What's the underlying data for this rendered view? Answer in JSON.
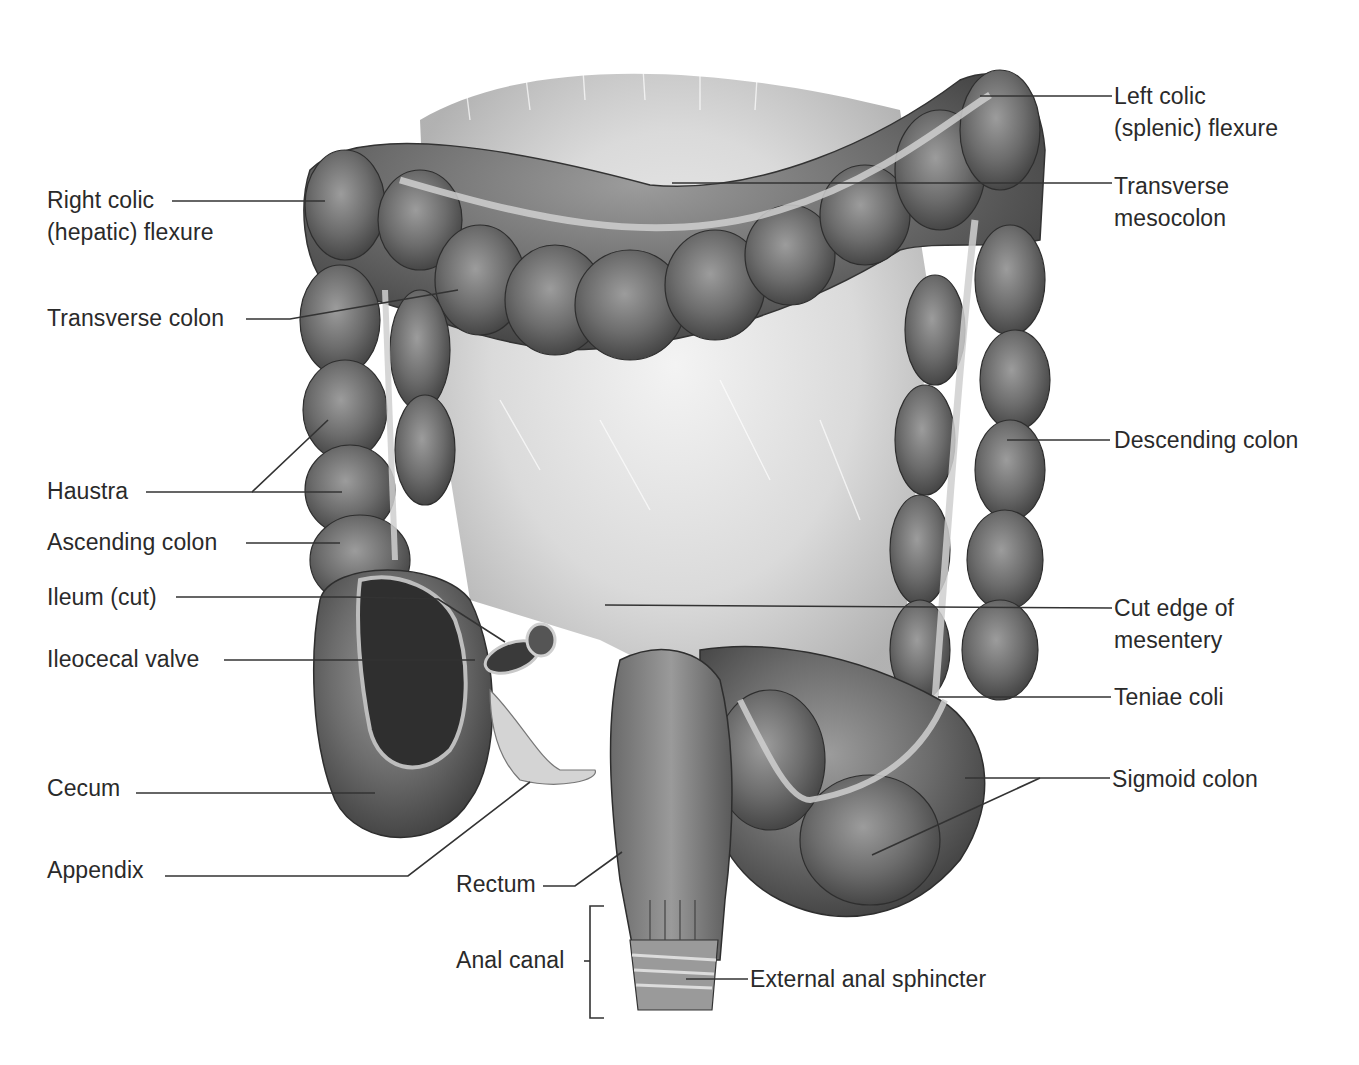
{
  "figure": {
    "labels_left": [
      {
        "id": "right-colic-flexure",
        "text": "Right colic\n(hepatic) flexure",
        "x": 47,
        "y": 184
      },
      {
        "id": "transverse-colon",
        "text": "Transverse colon",
        "x": 47,
        "y": 302
      },
      {
        "id": "haustra",
        "text": "Haustra",
        "x": 47,
        "y": 475
      },
      {
        "id": "ascending-colon",
        "text": "Ascending colon",
        "x": 47,
        "y": 526
      },
      {
        "id": "ileum-cut",
        "text": "Ileum (cut)",
        "x": 47,
        "y": 581
      },
      {
        "id": "ileocecal-valve",
        "text": "Ileocecal valve",
        "x": 47,
        "y": 643
      },
      {
        "id": "cecum",
        "text": "Cecum",
        "x": 47,
        "y": 772
      },
      {
        "id": "appendix",
        "text": "Appendix",
        "x": 47,
        "y": 854
      },
      {
        "id": "rectum",
        "text": "Rectum",
        "x": 456,
        "y": 868
      },
      {
        "id": "anal-canal",
        "text": "Anal canal",
        "x": 456,
        "y": 944
      }
    ],
    "labels_right": [
      {
        "id": "left-colic-flexure",
        "text": "Left colic\n(splenic) flexure",
        "x": 1114,
        "y": 80
      },
      {
        "id": "transverse-mesocolon",
        "text": "Transverse\nmesocolon",
        "x": 1114,
        "y": 170
      },
      {
        "id": "descending-colon",
        "text": "Descending colon",
        "x": 1114,
        "y": 424
      },
      {
        "id": "cut-edge-of-mesentery",
        "text": "Cut edge of\nmesentery",
        "x": 1114,
        "y": 592
      },
      {
        "id": "teniae-coli",
        "text": "Teniae coli",
        "x": 1114,
        "y": 681
      },
      {
        "id": "sigmoid-colon",
        "text": "Sigmoid colon",
        "x": 1112,
        "y": 763
      },
      {
        "id": "external-anal-sphincter",
        "text": "External anal sphincter",
        "x": 750,
        "y": 963
      }
    ],
    "leaders": [
      {
        "id": "right-colic-flexure",
        "points": "172,201 325,201"
      },
      {
        "id": "transverse-colon",
        "points": "246,319 290,319 458,290"
      },
      {
        "id": "haustra-a",
        "points": "146,492 252,492 328,420"
      },
      {
        "id": "haustra-b",
        "points": "252,492 342,492"
      },
      {
        "id": "ascending-colon",
        "points": "246,543 340,543"
      },
      {
        "id": "ileum-cut",
        "points": "176,597 350,597 438,599 505,642"
      },
      {
        "id": "ileocecal-valve",
        "points": "224,660 475,660"
      },
      {
        "id": "cecum",
        "points": "136,793 375,793"
      },
      {
        "id": "appendix",
        "points": "165,876 408,876 530,782"
      },
      {
        "id": "rectum",
        "points": "543,886 575,886 622,852"
      },
      {
        "id": "anal-canal-bracket",
        "points": "604,906 590,906 590,1018 604,1018"
      },
      {
        "id": "anal-canal-tick",
        "points": "584,961 590,961"
      },
      {
        "id": "external-anal-sphincter",
        "points": "686,979 748,979"
      },
      {
        "id": "left-colic-flexure",
        "points": "980,96 1112,96"
      },
      {
        "id": "transverse-mesocolon",
        "points": "672,183 1112,183"
      },
      {
        "id": "descending-colon",
        "points": "1007,440 1110,440"
      },
      {
        "id": "cut-edge-of-mesentery",
        "points": "605,605 1112,608"
      },
      {
        "id": "teniae-coli",
        "points": "938,697 1111,697"
      },
      {
        "id": "sigmoid-colon-a",
        "points": "965,778 1040,778 1110,778"
      },
      {
        "id": "sigmoid-colon-b",
        "points": "1040,778 872,855"
      }
    ],
    "colors": {
      "background": "#ffffff",
      "colon_dark": "#4a4a4a",
      "colon_mid": "#7a7a7a",
      "colon_light": "#a8a8a8",
      "mesentery": "#d9d9d9",
      "label_text": "#2a2a2a"
    }
  }
}
